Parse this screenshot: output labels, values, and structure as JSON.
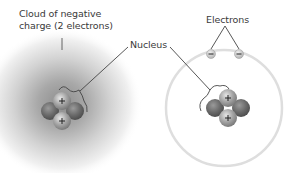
{
  "diagram": {
    "left_model": {
      "cloud_label_line1": "Cloud of negative",
      "cloud_label_line2": "charge (2 electrons)",
      "proton_sign": "+",
      "proton_count": 2,
      "neutron_count": 2
    },
    "shared": {
      "nucleus_label": "Nucleus"
    },
    "right_model": {
      "electrons_label": "Electrons",
      "electron_sign": "−",
      "electron_count": 2,
      "proton_sign": "+",
      "proton_count": 2,
      "neutron_count": 2
    },
    "colors": {
      "cloud_center": "#8a8a8a",
      "orbit": "#dcdcdc",
      "proton": "#a9a9a9",
      "neutron": "#6e6e6e",
      "line": "#444444",
      "text": "#3a3a3a"
    }
  }
}
